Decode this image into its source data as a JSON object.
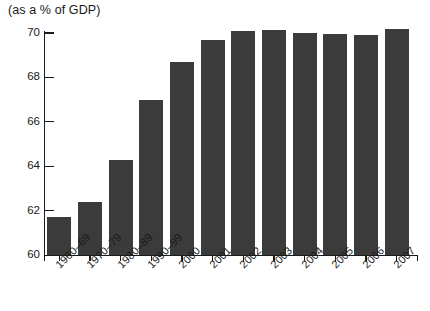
{
  "chart_data": {
    "type": "bar",
    "title": "(as a % of GDP)",
    "xlabel": "",
    "ylabel": "",
    "ylim": [
      60,
      70
    ],
    "yticks": [
      60,
      62,
      64,
      66,
      68,
      70
    ],
    "grid": false,
    "legend": null,
    "bar_color": "#3b3b3b",
    "categories": [
      "1960–69",
      "1970–79",
      "1980–89",
      "1990–99",
      "2000",
      "2001",
      "2002",
      "2003",
      "2004",
      "2005",
      "2006",
      "2007"
    ],
    "values": [
      61.7,
      62.4,
      64.3,
      67.0,
      68.7,
      69.7,
      70.1,
      70.15,
      70.0,
      69.95,
      69.9,
      70.2
    ]
  }
}
